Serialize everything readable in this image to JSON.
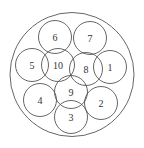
{
  "diagram": {
    "type": "circle-packing",
    "outer_circle": {
      "cx": 72,
      "cy": 74.5,
      "r": 62
    },
    "stroke_color": "#555555",
    "text_color": "#333333",
    "circles": [
      {
        "label": "1",
        "cx": 110,
        "cy": 67,
        "r": 16.5
      },
      {
        "label": "2",
        "cx": 101,
        "cy": 103,
        "r": 16.5
      },
      {
        "label": "3",
        "cx": 71,
        "cy": 117,
        "r": 16.5
      },
      {
        "label": "4",
        "cx": 40,
        "cy": 100,
        "r": 16.5
      },
      {
        "label": "5",
        "cx": 32,
        "cy": 65,
        "r": 16.5
      },
      {
        "label": "6",
        "cx": 55,
        "cy": 37,
        "r": 16.5
      },
      {
        "label": "7",
        "cx": 90,
        "cy": 38,
        "r": 16.5
      },
      {
        "label": "8",
        "cx": 86,
        "cy": 69,
        "r": 16.5
      },
      {
        "label": "9",
        "cx": 71,
        "cy": 92,
        "r": 16.5
      },
      {
        "label": "10",
        "cx": 58,
        "cy": 65,
        "r": 16.5
      }
    ]
  }
}
